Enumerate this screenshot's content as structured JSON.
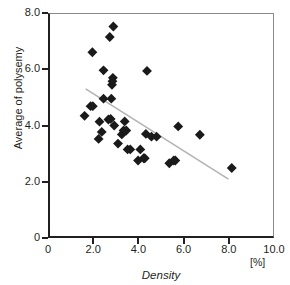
{
  "chart_data": {
    "type": "scatter",
    "title": "",
    "xlabel": "Density",
    "ylabel": "Average of polysemy",
    "x_unit": "[%]",
    "xlim": [
      0,
      10.0
    ],
    "ylim": [
      0,
      8.0
    ],
    "grid": false,
    "legend": "none",
    "xticks": [
      {
        "value": 0,
        "label": "0"
      },
      {
        "value": 2.0,
        "label": "2.0"
      },
      {
        "value": 4.0,
        "label": "4.0"
      },
      {
        "value": 6.0,
        "label": "6.0"
      },
      {
        "value": 8.0,
        "label": "8.0"
      },
      {
        "value": 10.0,
        "label": "10.0"
      }
    ],
    "yticks": [
      {
        "value": 0,
        "label": "0"
      },
      {
        "value": 2.0,
        "label": "2.0"
      },
      {
        "value": 4.0,
        "label": "4.0"
      },
      {
        "value": 6.0,
        "label": "6.0"
      },
      {
        "value": 8.0,
        "label": "8.0"
      }
    ],
    "marker": {
      "shape": "diamond",
      "color": "#1a1a1a",
      "size": 5
    },
    "points": [
      {
        "x": 1.55,
        "y": 4.33
      },
      {
        "x": 1.82,
        "y": 4.68
      },
      {
        "x": 1.92,
        "y": 4.68
      },
      {
        "x": 1.9,
        "y": 6.62
      },
      {
        "x": 2.18,
        "y": 3.5
      },
      {
        "x": 2.22,
        "y": 4.12
      },
      {
        "x": 2.32,
        "y": 3.75
      },
      {
        "x": 2.4,
        "y": 4.95
      },
      {
        "x": 2.4,
        "y": 5.97
      },
      {
        "x": 2.62,
        "y": 4.2
      },
      {
        "x": 2.68,
        "y": 7.17
      },
      {
        "x": 2.72,
        "y": 4.22
      },
      {
        "x": 2.75,
        "y": 4.95
      },
      {
        "x": 2.78,
        "y": 5.45
      },
      {
        "x": 2.8,
        "y": 5.58
      },
      {
        "x": 2.82,
        "y": 5.7
      },
      {
        "x": 2.84,
        "y": 7.55
      },
      {
        "x": 2.88,
        "y": 3.98
      },
      {
        "x": 3.05,
        "y": 3.33
      },
      {
        "x": 3.22,
        "y": 3.66
      },
      {
        "x": 3.3,
        "y": 3.8
      },
      {
        "x": 3.35,
        "y": 4.13
      },
      {
        "x": 3.42,
        "y": 3.8
      },
      {
        "x": 3.48,
        "y": 3.12
      },
      {
        "x": 3.6,
        "y": 3.12
      },
      {
        "x": 3.95,
        "y": 2.72
      },
      {
        "x": 4.05,
        "y": 3.12
      },
      {
        "x": 4.2,
        "y": 2.8
      },
      {
        "x": 4.25,
        "y": 2.8
      },
      {
        "x": 4.3,
        "y": 3.68
      },
      {
        "x": 4.35,
        "y": 5.95
      },
      {
        "x": 4.55,
        "y": 3.58
      },
      {
        "x": 4.78,
        "y": 3.58
      },
      {
        "x": 5.35,
        "y": 2.62
      },
      {
        "x": 5.55,
        "y": 2.72
      },
      {
        "x": 5.62,
        "y": 2.72
      },
      {
        "x": 5.75,
        "y": 3.95
      },
      {
        "x": 6.72,
        "y": 3.65
      },
      {
        "x": 8.15,
        "y": 2.45
      }
    ],
    "trendline": {
      "color": "#b3b3b3",
      "x_start": 1.6,
      "y_start": 5.3,
      "x_end": 8.0,
      "y_end": 2.05
    }
  }
}
